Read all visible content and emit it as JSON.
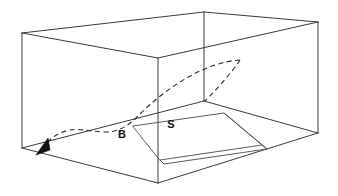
{
  "figure": {
    "kind": "line-drawing",
    "background_color": "#ffffff",
    "line_color": "#3a3a3a",
    "dashed_color": "#2b2b2b",
    "arrow_color": "#111111",
    "labels": {
      "b": "B",
      "s": "S"
    },
    "geometry": {
      "box_vertices": {
        "top_front_left": [
          22,
          33
        ],
        "top_back_left": [
          204,
          12
        ],
        "top_back_right": [
          318,
          22
        ],
        "top_front_right": [
          158,
          58
        ],
        "bottom_front_left": [
          22,
          148
        ],
        "bottom_back_left": [
          204,
          101
        ],
        "bottom_back_right": [
          318,
          133
        ],
        "bottom_front_right": [
          158,
          183
        ]
      },
      "slab_corners": [
        [
          133,
          126
        ],
        [
          224,
          113
        ],
        [
          262,
          145
        ],
        [
          160,
          160
        ]
      ],
      "trajectory_peak": [
        240,
        60
      ],
      "trajectory_end": [
        45,
        145
      ],
      "branch_end": [
        204,
        101
      ]
    }
  }
}
